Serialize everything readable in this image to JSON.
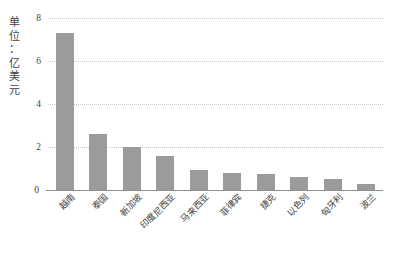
{
  "chart_data": {
    "type": "bar",
    "title": "",
    "subtitle": "",
    "xlabel": "",
    "ylabel": "单位：亿美元",
    "ylim": [
      0,
      8
    ],
    "yticks": [
      0,
      2,
      4,
      6,
      8
    ],
    "ytick_labels": [
      "0",
      "2",
      "4",
      "6",
      "8"
    ],
    "grid": true,
    "legend": false,
    "bar_color": "#9b9b9b",
    "categories": [
      "越南",
      "泰国",
      "新加坡",
      "印度尼西亚",
      "马来西亚",
      "菲律宾",
      "捷克",
      "以色列",
      "匈牙利",
      "波兰"
    ],
    "values": [
      7.3,
      2.6,
      2.0,
      1.6,
      0.95,
      0.8,
      0.75,
      0.6,
      0.5,
      0.28
    ],
    "series": [
      {
        "name": "",
        "values": [
          7.3,
          2.6,
          2.0,
          1.6,
          0.95,
          0.8,
          0.75,
          0.6,
          0.5,
          0.28
        ]
      }
    ]
  },
  "axis_title_chars": [
    "单",
    "位",
    "：",
    "亿",
    "美",
    "元"
  ]
}
